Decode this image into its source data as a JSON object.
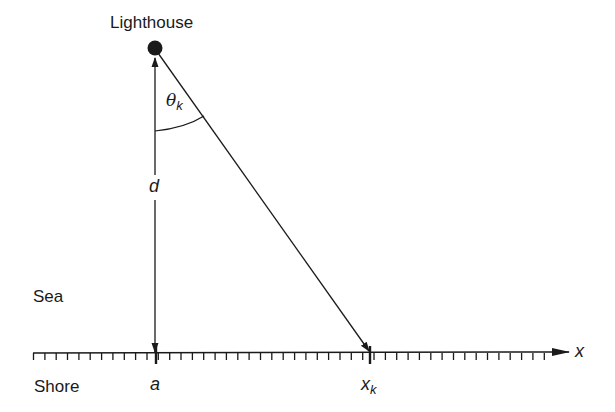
{
  "diagram": {
    "labels": {
      "lighthouse": "Lighthouse",
      "sea": "Sea",
      "shore": "Shore",
      "distance": "d",
      "angle_symbol": "θ",
      "angle_subscript": "k",
      "foot_point": "a",
      "flash_position": "x",
      "flash_subscript": "k",
      "axis": "x"
    },
    "colors": {
      "ink": "#1a1a1a",
      "background": "#ffffff"
    },
    "geometry": {
      "lighthouse": {
        "x": 155,
        "y": 48
      },
      "foot_point_a": {
        "x": 155,
        "y": 353
      },
      "flash_point_xk": {
        "x": 370,
        "y": 353
      },
      "shore_axis": {
        "x_start": 33,
        "x_end": 570,
        "y": 353
      },
      "tick_spacing_px": 11.35
    }
  }
}
